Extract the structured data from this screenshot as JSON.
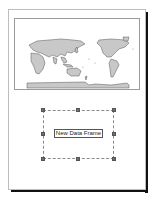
{
  "layout_page": {
    "background": "#ffffff",
    "shadow_color": "#111111"
  },
  "map_data_frame": {
    "content": "world-map-pacific-centered",
    "land_color": "#c8c8c8",
    "outline_color": "#555555"
  },
  "new_data_frame": {
    "label": "New Data Frame",
    "selected": true,
    "handles": [
      "top-left",
      "top-center",
      "top-right",
      "middle-left",
      "middle-right",
      "bottom-left",
      "bottom-center",
      "bottom-right"
    ]
  }
}
